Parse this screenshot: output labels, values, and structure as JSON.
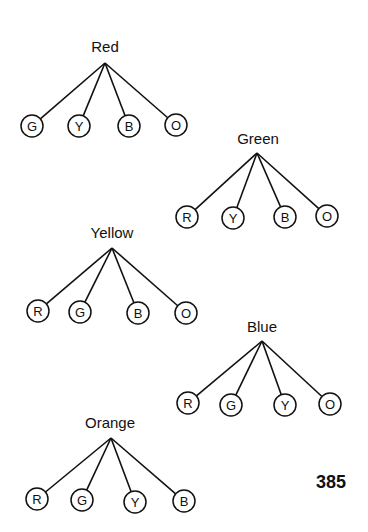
{
  "page_number": "385",
  "trees": [
    {
      "root": "Red",
      "label_pos": [
        105,
        52
      ],
      "apex": [
        105,
        63
      ],
      "children": [
        {
          "letter": "G",
          "pos": [
            32,
            126
          ]
        },
        {
          "letter": "Y",
          "pos": [
            79,
            126
          ]
        },
        {
          "letter": "B",
          "pos": [
            129,
            126
          ]
        },
        {
          "letter": "O",
          "pos": [
            176,
            125
          ]
        }
      ]
    },
    {
      "root": "Green",
      "label_pos": [
        258,
        144
      ],
      "apex": [
        257,
        153
      ],
      "children": [
        {
          "letter": "R",
          "pos": [
            187,
            217
          ]
        },
        {
          "letter": "Y",
          "pos": [
            233,
            218
          ]
        },
        {
          "letter": "B",
          "pos": [
            285,
            217
          ]
        },
        {
          "letter": "O",
          "pos": [
            327,
            216
          ]
        }
      ]
    },
    {
      "root": "Yellow",
      "label_pos": [
        112,
        238
      ],
      "apex": [
        112,
        248
      ],
      "children": [
        {
          "letter": "R",
          "pos": [
            38,
            311
          ]
        },
        {
          "letter": "G",
          "pos": [
            80,
            312
          ]
        },
        {
          "letter": "B",
          "pos": [
            138,
            313
          ]
        },
        {
          "letter": "O",
          "pos": [
            186,
            313
          ]
        }
      ]
    },
    {
      "root": "Blue",
      "label_pos": [
        262,
        332
      ],
      "apex": [
        262,
        341
      ],
      "children": [
        {
          "letter": "R",
          "pos": [
            188,
            403
          ]
        },
        {
          "letter": "G",
          "pos": [
            231,
            405
          ]
        },
        {
          "letter": "Y",
          "pos": [
            285,
            405
          ]
        },
        {
          "letter": "O",
          "pos": [
            330,
            404
          ]
        }
      ]
    },
    {
      "root": "Orange",
      "label_pos": [
        110,
        428
      ],
      "apex": [
        111,
        438
      ],
      "children": [
        {
          "letter": "R",
          "pos": [
            37,
            499
          ]
        },
        {
          "letter": "G",
          "pos": [
            82,
            500
          ]
        },
        {
          "letter": "Y",
          "pos": [
            135,
            502
          ]
        },
        {
          "letter": "B",
          "pos": [
            184,
            501
          ]
        }
      ]
    }
  ]
}
